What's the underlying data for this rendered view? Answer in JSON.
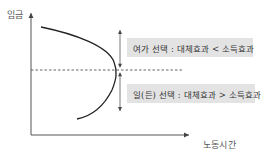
{
  "diagram": {
    "title": "",
    "axes": {
      "y_label": "임금",
      "x_label": "노동시간"
    },
    "regions": {
      "upper": {
        "label": "여가 선택 : 대체효과 < 소득효과"
      },
      "lower": {
        "label": "일(든) 선택 : 대체효과 > 소득효과"
      }
    },
    "curve": {
      "name": "backward-bending labor supply curve",
      "description": "upper part bends backward toward less labor; lower part slopes upward"
    },
    "dashed_line": "threshold wage",
    "colors": {
      "axis": "#555555",
      "curve": "#222222",
      "box_fill": "#e3e3e3",
      "text": "#333333"
    }
  }
}
